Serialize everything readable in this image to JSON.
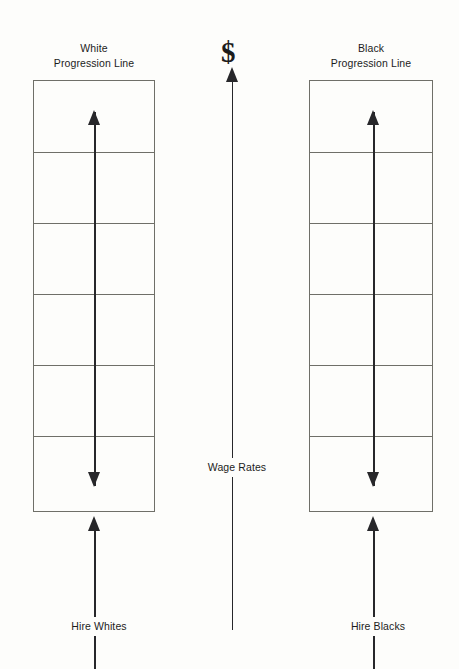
{
  "diagram": {
    "title_left": "White\nProgression Line",
    "left_ladder": {
      "heading_line1": "White",
      "heading_line2": "Progression Line",
      "rows": 6,
      "entry_label": "Hire Whites"
    },
    "right_ladder": {
      "heading_line1": "Black",
      "heading_line2": "Progression Line",
      "rows": 6,
      "entry_label": "Hire Blacks"
    },
    "center_axis": {
      "symbol": "$",
      "label": "Wage Rates"
    },
    "colors": {
      "ink": "#1c1c1c",
      "arrow": "#27272a",
      "box_line": "#6f6f68",
      "paper": "#fdfdfb"
    }
  }
}
